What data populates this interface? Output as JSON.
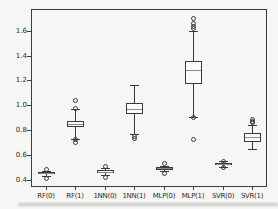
{
  "figure": {
    "kind": "boxplot-figure",
    "background": "#f6f6f4"
  },
  "colors": {
    "line": "#3a3a3a",
    "median": "#8a8a8a",
    "box_fill": "#fbfbfa",
    "text": "#2b2b2b",
    "background": "#f6f6f4"
  },
  "chart_data": {
    "type": "boxplot",
    "title": "",
    "xlabel": "",
    "ylabel": "",
    "grid": false,
    "categories": [
      "RF(0)",
      "RF(1)",
      "1NN(0)",
      "1NN(1)",
      "MLP(0)",
      "MLP(1)",
      "SVR(0)",
      "SVR(1)"
    ],
    "yticks": [
      0.4,
      0.6,
      0.8,
      1.0,
      1.2,
      1.4,
      1.6
    ],
    "ytick_labels": [
      "0.4",
      "0.6",
      "0.8",
      "1.0",
      "1.2",
      "1.4",
      "1.6"
    ],
    "ylim": [
      0.34,
      1.775
    ],
    "series": [
      {
        "category": "RF(0)",
        "whisker_low": 0.43,
        "q1": 0.444,
        "median": 0.452,
        "q3": 0.462,
        "whisker_high": 0.472,
        "outliers": [
          0.487,
          0.415
        ]
      },
      {
        "category": "RF(1)",
        "whisker_low": 0.728,
        "q1": 0.82,
        "median": 0.845,
        "q3": 0.872,
        "whisker_high": 0.968,
        "outliers": [
          1.045,
          0.975,
          0.725,
          0.705
        ]
      },
      {
        "category": "1NN(0)",
        "whisker_low": 0.435,
        "q1": 0.454,
        "median": 0.464,
        "q3": 0.476,
        "whisker_high": 0.49,
        "outliers": [
          0.506,
          0.42
        ]
      },
      {
        "category": "1NN(1)",
        "whisker_low": 0.766,
        "q1": 0.925,
        "median": 0.965,
        "q3": 1.021,
        "whisker_high": 1.163,
        "outliers": [
          0.755,
          0.737
        ]
      },
      {
        "category": "MLP(0)",
        "whisker_low": 0.468,
        "q1": 0.481,
        "median": 0.49,
        "q3": 0.5,
        "whisker_high": 0.512,
        "outliers": [
          0.532,
          0.456
        ]
      },
      {
        "category": "MLP(1)",
        "whisker_low": 0.908,
        "q1": 1.168,
        "median": 1.284,
        "q3": 1.356,
        "whisker_high": 1.6,
        "outliers": [
          1.703,
          1.66,
          1.638,
          1.62,
          0.905,
          0.73
        ]
      },
      {
        "category": "SVR(0)",
        "whisker_low": 0.504,
        "q1": 0.515,
        "median": 0.525,
        "q3": 0.536,
        "whisker_high": 0.546,
        "outliers": [
          0.551,
          0.498
        ]
      },
      {
        "category": "SVR(1)",
        "whisker_low": 0.645,
        "q1": 0.705,
        "median": 0.74,
        "q3": 0.776,
        "whisker_high": 0.84,
        "outliers": [
          0.89,
          0.876,
          0.866
        ]
      }
    ]
  }
}
